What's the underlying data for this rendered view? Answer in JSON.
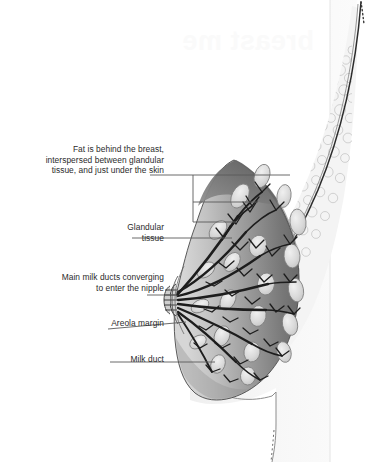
{
  "figure": {
    "title_watermark": "breast me",
    "background_color": "#ffffff",
    "label_color": "#2b2b2b",
    "leader_line_color": "#5a5a5a",
    "colors": {
      "skin_line": "#2e2e2e",
      "fat_fill": "#f2f2f2",
      "fat_cell_stroke": "#b9b9b9",
      "gland_light": "#c9c9c9",
      "gland_dark": "#6e6e6e",
      "lobule_fill": "#dcdcdc",
      "lobule_stroke": "#8a8a8a",
      "duct_stroke": "#1f1f1f",
      "chest_wall_fill": "#f7f7f7"
    },
    "labels": [
      {
        "id": "fat",
        "text": "Fat is behind the breast,\ninterspersed between glandular\ntissue, and just under the skin",
        "leader": "bracket-three-branch"
      },
      {
        "id": "glandular",
        "text": "Glandular\ntissue",
        "leader": "straight"
      },
      {
        "id": "main-ducts",
        "text": "Main milk ducts converging\nto enter the nipple",
        "leader": "straight"
      },
      {
        "id": "areola",
        "text": "Areola margin",
        "leader": "straight-sloped"
      },
      {
        "id": "milk-duct",
        "text": "Milk duct",
        "leader": "straight"
      }
    ]
  }
}
